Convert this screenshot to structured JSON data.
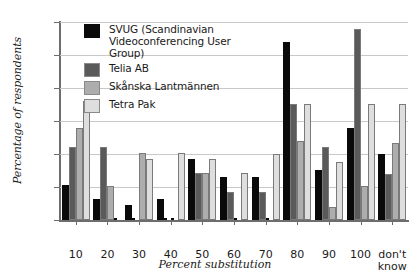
{
  "chart_data": {
    "type": "bar",
    "title": "",
    "xlabel": "Percent substitution",
    "ylabel": "Percentage of respondents",
    "ylim": [
      0,
      30
    ],
    "yticks": [
      0,
      5,
      10,
      15,
      20,
      25,
      30
    ],
    "ytick_labels": [
      "0",
      "5",
      "10",
      "15",
      "20",
      "25",
      "30"
    ],
    "grid": true,
    "legend_position": "upper-left-inside",
    "categories": [
      "10",
      "20",
      "30",
      "40",
      "50",
      "60",
      "70",
      "80",
      "90",
      "100",
      "don't know"
    ],
    "series": [
      {
        "name": "SVUG (Scandinavian Videoconferencing User Group)",
        "color": "#0a0a0a",
        "values": [
          5.3,
          3.2,
          2.2,
          3.2,
          9.2,
          6.5,
          6.5,
          27.0,
          7.6,
          14.0,
          10.0
        ]
      },
      {
        "name": "Telia AB",
        "color": "#5a5a5a",
        "values": [
          11.0,
          11.1,
          0,
          0,
          7.1,
          4.2,
          4.2,
          17.6,
          11.0,
          29.0,
          7.0
        ]
      },
      {
        "name": "Skånska Lantmännen",
        "color": "#adadad",
        "values": [
          14.0,
          5.2,
          10.1,
          0,
          7.1,
          0,
          0,
          12.0,
          2.0,
          5.2,
          11.6
        ]
      },
      {
        "name": "Tetra Pak",
        "color": "#dedede",
        "values": [
          18.0,
          0,
          9.2,
          10.1,
          9.2,
          7.1,
          10.0,
          17.6,
          8.8,
          17.6,
          17.6
        ]
      }
    ]
  }
}
